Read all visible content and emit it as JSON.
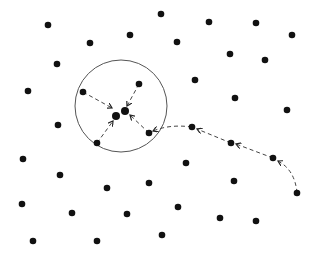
{
  "diagram": {
    "title": "",
    "colors": {
      "background": "#ffffff",
      "dot": "#111111",
      "circle": "#555555",
      "arrow": "#444444"
    },
    "circle": {
      "cx": 121,
      "cy": 106,
      "r": 46
    },
    "cluster_center": [
      {
        "x": 116,
        "y": 116
      },
      {
        "x": 125,
        "y": 111
      }
    ],
    "dots": [
      {
        "x": 48,
        "y": 25
      },
      {
        "x": 90,
        "y": 43
      },
      {
        "x": 130,
        "y": 35
      },
      {
        "x": 161,
        "y": 14
      },
      {
        "x": 209,
        "y": 22
      },
      {
        "x": 256,
        "y": 23
      },
      {
        "x": 292,
        "y": 35
      },
      {
        "x": 177,
        "y": 42
      },
      {
        "x": 230,
        "y": 54
      },
      {
        "x": 265,
        "y": 60
      },
      {
        "x": 57,
        "y": 64
      },
      {
        "x": 195,
        "y": 80
      },
      {
        "x": 28,
        "y": 91
      },
      {
        "x": 235,
        "y": 98
      },
      {
        "x": 287,
        "y": 110
      },
      {
        "x": 58,
        "y": 125
      },
      {
        "x": 23,
        "y": 159
      },
      {
        "x": 60,
        "y": 175
      },
      {
        "x": 107,
        "y": 188
      },
      {
        "x": 149,
        "y": 183
      },
      {
        "x": 186,
        "y": 163
      },
      {
        "x": 234,
        "y": 181
      },
      {
        "x": 22,
        "y": 204
      },
      {
        "x": 72,
        "y": 213
      },
      {
        "x": 127,
        "y": 214
      },
      {
        "x": 178,
        "y": 207
      },
      {
        "x": 220,
        "y": 218
      },
      {
        "x": 256,
        "y": 221
      },
      {
        "x": 33,
        "y": 241
      },
      {
        "x": 97,
        "y": 241
      },
      {
        "x": 162,
        "y": 235
      }
    ],
    "inner_dots": [
      {
        "x": 83,
        "y": 92
      },
      {
        "x": 139,
        "y": 84
      },
      {
        "x": 97,
        "y": 143
      },
      {
        "x": 149,
        "y": 133
      }
    ],
    "path_dots": [
      {
        "x": 192,
        "y": 127
      },
      {
        "x": 231,
        "y": 143
      },
      {
        "x": 273,
        "y": 158
      },
      {
        "x": 297,
        "y": 193
      }
    ],
    "arrows": [
      {
        "from": [
          83,
          92
        ],
        "to": [
          112,
          108
        ]
      },
      {
        "from": [
          139,
          84
        ],
        "to": [
          127,
          106
        ]
      },
      {
        "from": [
          97,
          143
        ],
        "to": [
          113,
          121
        ]
      },
      {
        "from": [
          149,
          133
        ],
        "to": [
          130,
          115
        ]
      },
      {
        "from": [
          192,
          127
        ],
        "to": [
          153,
          131
        ],
        "curve": [
          170,
          124
        ]
      },
      {
        "from": [
          231,
          143
        ],
        "to": [
          197,
          129
        ]
      },
      {
        "from": [
          273,
          158
        ],
        "to": [
          236,
          144
        ]
      },
      {
        "from": [
          297,
          193
        ],
        "to": [
          278,
          161
        ],
        "curve": [
          295,
          170
        ]
      }
    ]
  }
}
